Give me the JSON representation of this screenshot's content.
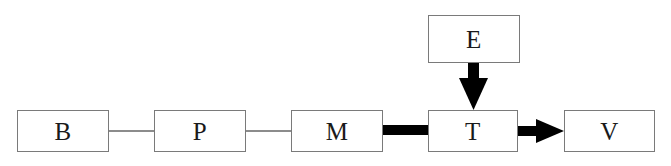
{
  "diagram": {
    "background_color": "#ffffff",
    "box_border_color": "#7a7a7a",
    "box_fill_color": "#ffffff",
    "label_color": "#1a1a1a",
    "thin_link_color": "#8c8c8c",
    "thick_link_color": "#000000",
    "nodes": [
      {
        "id": "B",
        "label": "B",
        "x": 17,
        "y": 110,
        "width": 92,
        "height": 42
      },
      {
        "id": "P",
        "label": "P",
        "x": 154,
        "y": 110,
        "width": 92,
        "height": 42
      },
      {
        "id": "M",
        "label": "M",
        "x": 291,
        "y": 110,
        "width": 92,
        "height": 42
      },
      {
        "id": "T",
        "label": "T",
        "x": 428,
        "y": 110,
        "width": 90,
        "height": 42
      },
      {
        "id": "V",
        "label": "V",
        "x": 564,
        "y": 110,
        "width": 91,
        "height": 42
      },
      {
        "id": "E",
        "label": "E",
        "x": 428,
        "y": 15,
        "width": 92,
        "height": 48
      }
    ],
    "edges": [
      {
        "id": "B-P",
        "from": "B",
        "to": "P",
        "style": "thin-line",
        "arrow": "none",
        "orientation": "horizontal"
      },
      {
        "id": "P-M",
        "from": "P",
        "to": "M",
        "style": "thin-line",
        "arrow": "none",
        "orientation": "horizontal"
      },
      {
        "id": "M-T",
        "from": "M",
        "to": "T",
        "style": "thick-bar",
        "arrow": "none",
        "orientation": "horizontal"
      },
      {
        "id": "E-T",
        "from": "E",
        "to": "T",
        "style": "thick-arrow",
        "arrow": "end",
        "orientation": "vertical-down"
      },
      {
        "id": "T-V",
        "from": "T",
        "to": "V",
        "style": "thick-arrow",
        "arrow": "end",
        "orientation": "horizontal-right"
      }
    ]
  }
}
